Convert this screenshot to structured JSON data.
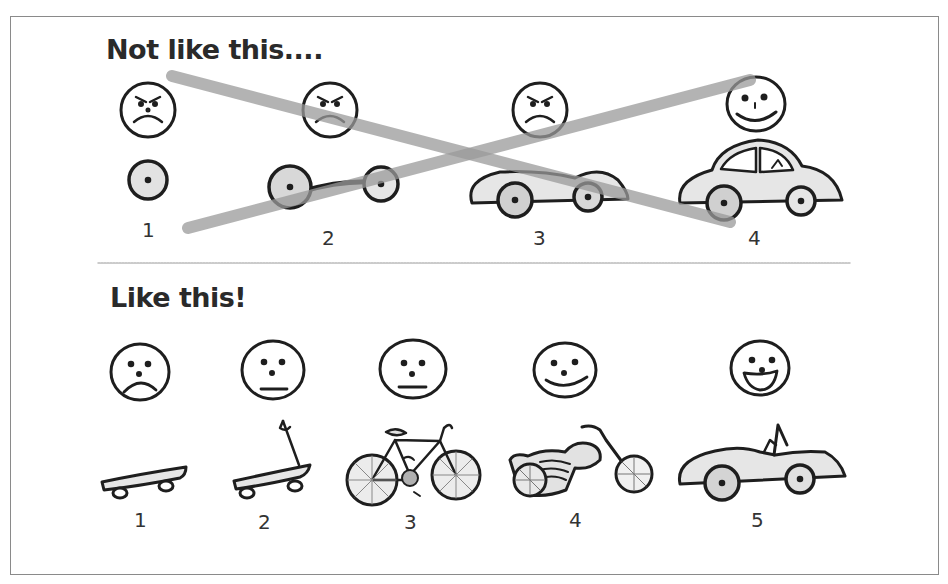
{
  "sections": {
    "top": {
      "title": "Not like this....",
      "steps": [
        {
          "number": "1",
          "mood": "angry",
          "vehicle": "wheel"
        },
        {
          "number": "2",
          "mood": "angry",
          "vehicle": "axle-with-two-wheels"
        },
        {
          "number": "3",
          "mood": "angry",
          "vehicle": "car-body-without-cabin"
        },
        {
          "number": "4",
          "mood": "happy",
          "vehicle": "car"
        }
      ],
      "overlay": "crossed-out-x"
    },
    "bottom": {
      "title": "Like this!",
      "steps": [
        {
          "number": "1",
          "mood": "sad",
          "vehicle": "skateboard"
        },
        {
          "number": "2",
          "mood": "neutral",
          "vehicle": "scooter"
        },
        {
          "number": "3",
          "mood": "neutral",
          "vehicle": "bicycle"
        },
        {
          "number": "4",
          "mood": "happy",
          "vehicle": "motorcycle"
        },
        {
          "number": "5",
          "mood": "very-happy",
          "vehicle": "convertible-car"
        }
      ]
    }
  },
  "colors": {
    "ink": "#1e1e1e",
    "fill": "#e6e6e6",
    "hub": "#bdbdbd",
    "strike": "#9a9a9a",
    "divider": "#bbbbbb",
    "border": "#8a8a8a"
  }
}
